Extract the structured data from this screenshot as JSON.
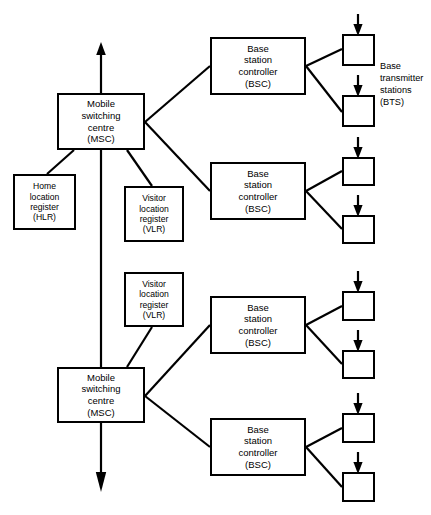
{
  "diagram": {
    "stroke_color": "#000000",
    "background_color": "#ffffff",
    "nodes": {
      "msc_top": {
        "lines": [
          "Mobile",
          "switching",
          "centre",
          "(MSC)"
        ]
      },
      "msc_bottom": {
        "lines": [
          "Mobile",
          "switching",
          "centre",
          "(MSC)"
        ]
      },
      "hlr": {
        "lines": [
          "Home",
          "location",
          "register",
          "(HLR)"
        ]
      },
      "vlr_top": {
        "lines": [
          "Visitor",
          "location",
          "register",
          "(VLR)"
        ]
      },
      "vlr_bottom": {
        "lines": [
          "Visitor",
          "location",
          "register",
          "(VLR)"
        ]
      },
      "bsc_1": {
        "lines": [
          "Base",
          "station",
          "controller",
          "(BSC)"
        ]
      },
      "bsc_2": {
        "lines": [
          "Base",
          "station",
          "controller",
          "(BSC)"
        ]
      },
      "bsc_3": {
        "lines": [
          "Base",
          "station",
          "controller",
          "(BSC)"
        ]
      },
      "bsc_4": {
        "lines": [
          "Base",
          "station",
          "controller",
          "(BSC)"
        ]
      },
      "bts_1": {
        "lines": []
      },
      "bts_2": {
        "lines": []
      },
      "bts_3": {
        "lines": []
      },
      "bts_4": {
        "lines": []
      },
      "bts_5": {
        "lines": []
      },
      "bts_6": {
        "lines": []
      },
      "bts_7": {
        "lines": []
      },
      "bts_8": {
        "lines": []
      }
    },
    "labels": {
      "bts_group": {
        "lines": [
          "Base",
          "transmitter",
          "stations",
          "(BTS)"
        ]
      }
    }
  }
}
